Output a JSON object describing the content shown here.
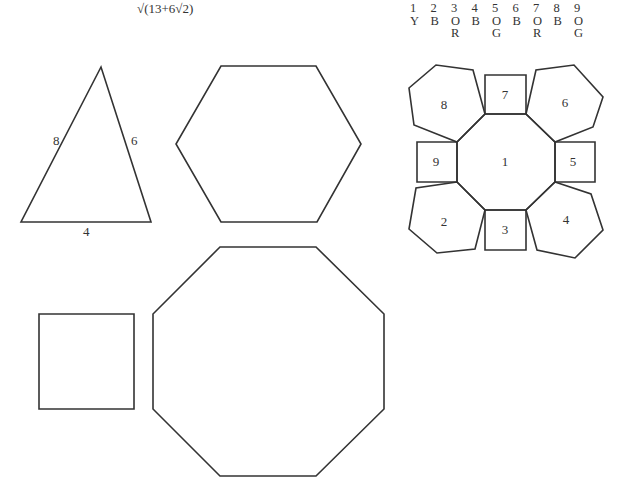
{
  "formula": "√(13+6√2)",
  "legend": {
    "numbers": [
      "1",
      "2",
      "3",
      "4",
      "5",
      "6",
      "7",
      "8",
      "9"
    ],
    "colors_row1": [
      "Y",
      "B",
      "O",
      "B",
      "O",
      "B",
      "O",
      "B",
      "O"
    ],
    "colors_row2": [
      "",
      "",
      "R",
      "",
      "G",
      "",
      "R",
      "",
      "G"
    ]
  },
  "triangle": {
    "points": "101,67 21,222 151,222",
    "side_labels": [
      {
        "text": "8",
        "x": 53,
        "y": 145
      },
      {
        "text": "6",
        "x": 131,
        "y": 145
      },
      {
        "text": "4",
        "x": 83,
        "y": 236
      }
    ]
  },
  "hexagon": {
    "points": "221,66 316,66 361,144 317,222 221,222 176,144"
  },
  "square": {
    "points": "39,314 134,314 134,409 39,409"
  },
  "octagon": {
    "points": "220,247 316,247 384,314 384,409 316,476 220,476 153,409 153,314"
  },
  "net": {
    "faces": [
      {
        "id": "1",
        "kind": "octagon",
        "points": "485,114 526,114 555,142 555,182 526,210 485,210 457,182 457,142",
        "label_x": 505,
        "label_y": 166
      },
      {
        "id": "2",
        "kind": "hexagon",
        "points": "457,182 416,188 409,229 437,253 475,249 485,210",
        "label_x": 444,
        "label_y": 226
      },
      {
        "id": "3",
        "kind": "square",
        "points": "485,210 526,210 526,250 485,250",
        "label_x": 505,
        "label_y": 234
      },
      {
        "id": "4",
        "kind": "hexagon",
        "points": "555,182 591,194 603,230 575,258 537,250 526,210",
        "label_x": 566,
        "label_y": 224
      },
      {
        "id": "5",
        "kind": "square",
        "points": "555,142 595,142 595,182 555,182",
        "label_x": 573,
        "label_y": 166
      },
      {
        "id": "6",
        "kind": "hexagon",
        "points": "526,114 536,70 574,65 603,97 593,127 555,142",
        "label_x": 565,
        "label_y": 107
      },
      {
        "id": "7",
        "kind": "square",
        "points": "485,75 526,75 526,114 485,114",
        "label_x": 505,
        "label_y": 99
      },
      {
        "id": "8",
        "kind": "hexagon",
        "points": "485,114 473,70 436,65 409,88 414,125 457,142",
        "label_x": 444,
        "label_y": 109
      },
      {
        "id": "9",
        "kind": "square",
        "points": "417,142 457,142 457,182 417,182",
        "label_x": 436,
        "label_y": 166
      }
    ]
  }
}
